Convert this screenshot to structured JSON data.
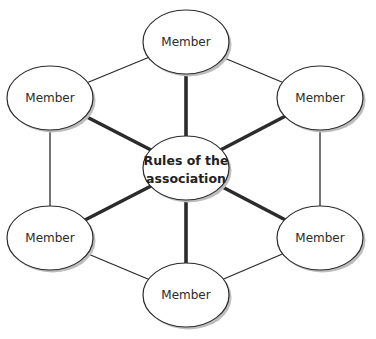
{
  "diagram": {
    "type": "hub-and-ring network",
    "center": {
      "id": "rules",
      "lines": [
        "Rules of the",
        "association"
      ],
      "cx": 186,
      "cy": 168
    },
    "members": [
      {
        "id": "m-top",
        "label": "Member",
        "cx": 186,
        "cy": 42
      },
      {
        "id": "m-top-right",
        "label": "Member",
        "cx": 320,
        "cy": 98
      },
      {
        "id": "m-bottom-right",
        "label": "Member",
        "cx": 320,
        "cy": 238
      },
      {
        "id": "m-bottom",
        "label": "Member",
        "cx": 186,
        "cy": 295
      },
      {
        "id": "m-bottom-left",
        "label": "Member",
        "cx": 50,
        "cy": 238
      },
      {
        "id": "m-top-left",
        "label": "Member",
        "cx": 50,
        "cy": 98
      }
    ],
    "ellipse": {
      "rx": 43,
      "ry": 32
    },
    "colors": {
      "stroke": "#2b2b2b",
      "fill": "#ffffff",
      "shadow": "#bdbdbd"
    },
    "edges": {
      "spokes_thick": [
        "rules-m-top",
        "rules-m-top-right",
        "rules-m-bottom-right",
        "rules-m-bottom",
        "rules-m-bottom-left",
        "rules-m-top-left"
      ],
      "ring_thin": [
        "m-top-m-top-right",
        "m-top-right-m-bottom-right",
        "m-bottom-right-m-bottom",
        "m-bottom-m-bottom-left",
        "m-bottom-left-m-top-left",
        "m-top-left-m-top"
      ]
    }
  }
}
